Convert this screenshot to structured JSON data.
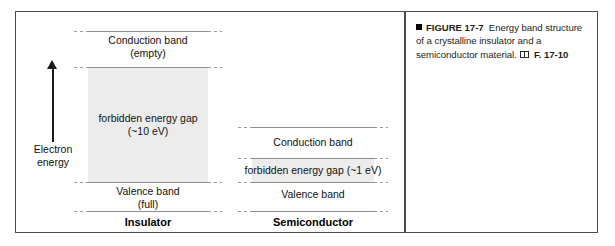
{
  "figure": {
    "caption": {
      "bullet_icon": "filled-square-bullet",
      "label": "FIGURE 17-7",
      "body": "Energy band structure of a crystalline insulator and a semiconductor material.",
      "book_icon": "book-icon",
      "cross_reference": "F. 17-10"
    }
  },
  "diagram": {
    "axis": {
      "arrow_icon": "up-arrow-icon",
      "label_line1": "Electron",
      "label_line2": "energy"
    },
    "columns": [
      {
        "name": "insulator",
        "material_label": "Insulator",
        "bands": [
          {
            "name": "conduction-band",
            "line1": "Conduction band",
            "line2": "(empty)"
          },
          {
            "name": "forbidden-gap",
            "line1": "forbidden energy gap",
            "line2": "(~10 eV)",
            "shaded": true
          },
          {
            "name": "valence-band",
            "line1": "Valence band",
            "line2": "(full)"
          }
        ]
      },
      {
        "name": "semiconductor",
        "material_label": "Semiconductor",
        "bands": [
          {
            "name": "conduction-band",
            "line1": "Conduction band",
            "line2": ""
          },
          {
            "name": "forbidden-gap",
            "line1": "forbidden energy gap (~1 eV)",
            "line2": "",
            "shaded": true
          },
          {
            "name": "valence-band",
            "line1": "Valence band",
            "line2": ""
          }
        ]
      }
    ]
  },
  "colors": {
    "frame": "#4c4c4c",
    "band_line": "#8e8e8e",
    "gap_shade": "#ececec",
    "text": "#121212",
    "caption_text": "#231f20"
  }
}
